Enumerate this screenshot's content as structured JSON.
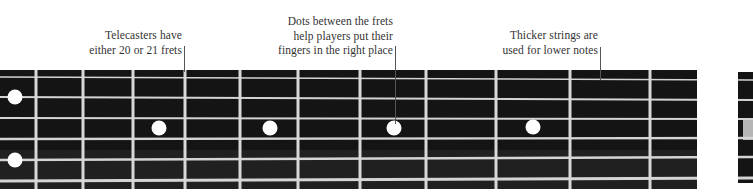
{
  "annotations": [
    {
      "id": "frets",
      "lines": [
        "Telecasters have",
        "either 20 or 21 frets"
      ],
      "right": 184,
      "top": 28,
      "leader": {
        "x": 184,
        "y1": 46,
        "y2": 72
      }
    },
    {
      "id": "dots",
      "lines": [
        "Dots between the frets",
        "help players put their",
        "fingers in the right place"
      ],
      "right": 395,
      "top": 14,
      "leader": {
        "x": 395,
        "y1": 46,
        "y2": 124
      }
    },
    {
      "id": "strings",
      "lines": [
        "Thicker strings are",
        "used for lower notes"
      ],
      "right": 600,
      "top": 28,
      "leader": {
        "x": 600,
        "y1": 47,
        "y2": 80
      }
    }
  ],
  "fretboard": {
    "top": 70,
    "bottom": 189,
    "color": "#141414",
    "fret_color": "#d8d8d8",
    "string_color": "#d4d4d4",
    "frets_x": [
      36,
      83,
      133,
      185,
      240,
      298,
      360,
      426,
      496,
      570,
      650
    ],
    "board_end_x": 697,
    "nut_x": 740,
    "strings_y_left": [
      77,
      97,
      118,
      139,
      160,
      181
    ],
    "strings_y_right": [
      80,
      100,
      119,
      138,
      157,
      178
    ],
    "dots": [
      {
        "x": 15,
        "y": 97
      },
      {
        "x": 15,
        "y": 160
      },
      {
        "x": 159,
        "y": 128
      },
      {
        "x": 270,
        "y": 128
      },
      {
        "x": 394,
        "y": 128
      },
      {
        "x": 533,
        "y": 127
      }
    ],
    "nut_block": {
      "x": 743,
      "y": 120,
      "w": 10,
      "h": 20,
      "color": "#b5b5b5"
    }
  }
}
